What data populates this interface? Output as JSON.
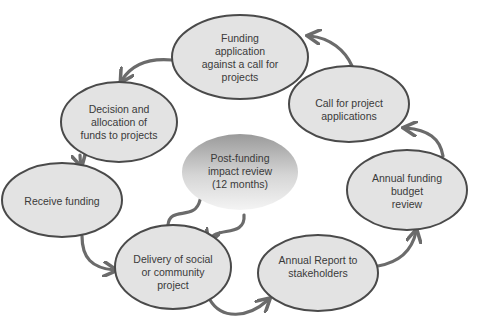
{
  "diagram": {
    "type": "cycle",
    "colors": {
      "node_fill": "#e3e3e3",
      "node_stroke": "#4a4a4a",
      "arrow": "#6b6b6b",
      "center_fill_top": "#9c9c9c",
      "center_fill_bottom": "#f2f2f2",
      "text": "#3a3a3a"
    },
    "nodes": [
      {
        "id": "funding-application",
        "lines": [
          "Funding",
          "application",
          "against a call for",
          "projects"
        ]
      },
      {
        "id": "call-for-projects",
        "lines": [
          "Call for project",
          "applications"
        ]
      },
      {
        "id": "annual-budget-review",
        "lines": [
          "Annual funding",
          "budget",
          "review"
        ]
      },
      {
        "id": "annual-report",
        "lines": [
          "Annual Report to",
          "stakeholders"
        ]
      },
      {
        "id": "delivery",
        "lines": [
          "Delivery of social",
          "or community",
          "project"
        ]
      },
      {
        "id": "receive-funding",
        "lines": [
          "Receive funding"
        ]
      },
      {
        "id": "decision",
        "lines": [
          "Decision and",
          "allocation of",
          "funds to projects"
        ]
      },
      {
        "id": "post-funding-review",
        "lines": [
          "Post-funding",
          "impact review",
          "(12 months)"
        ]
      }
    ],
    "edges": [
      {
        "from": "call-for-projects",
        "to": "funding-application"
      },
      {
        "from": "funding-application",
        "to": "decision"
      },
      {
        "from": "decision",
        "to": "receive-funding"
      },
      {
        "from": "receive-funding",
        "to": "delivery"
      },
      {
        "from": "delivery",
        "to": "annual-report"
      },
      {
        "from": "annual-report",
        "to": "annual-budget-review"
      },
      {
        "from": "annual-budget-review",
        "to": "call-for-projects"
      },
      {
        "from": "delivery",
        "to": "post-funding-review"
      },
      {
        "from": "post-funding-review",
        "to": "delivery"
      }
    ]
  }
}
